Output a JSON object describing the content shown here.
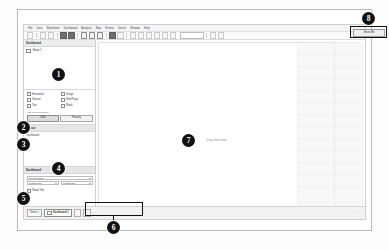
{
  "app": {
    "name": "Tableau Desktop",
    "menu": [
      "File",
      "Data",
      "Worksheet",
      "Dashboard",
      "Analysis",
      "Map",
      "Format",
      "Server",
      "Window",
      "Help"
    ],
    "toolbar_icons": [
      "tableau-logo-icon",
      "back-arrow-icon",
      "forward-arrow-icon",
      "save-icon",
      "new-data-source-icon",
      "pause-refresh-icon",
      "refresh-icon",
      "clear-sheet-icon",
      "undo-icon",
      "redo-icon",
      "swap-rows-columns-icon",
      "sort-ascending-icon",
      "sort-descending-icon",
      "highlight-icon",
      "group-members-icon",
      "show-labels-icon",
      "fit-dropdown-icon",
      "fix-axes-icon",
      "presentation-mode-icon"
    ],
    "toolbar_fit_value": "Standard"
  },
  "left_pane": {
    "title": "Dashboard",
    "sheets_label": "Sheet 1",
    "sheets": [
      {
        "label": "Sheet 1",
        "icon": "worksheet-icon"
      }
    ],
    "objects_title": "Objects",
    "objects": [
      {
        "label": "Horizontal",
        "icon": "horizontal-container-icon"
      },
      {
        "label": "Image",
        "icon": "image-object-icon"
      },
      {
        "label": "Vertical",
        "icon": "vertical-container-icon"
      },
      {
        "label": "Web Page",
        "icon": "web-page-object-icon"
      },
      {
        "label": "Text",
        "icon": "text-object-icon"
      },
      {
        "label": "Blank",
        "icon": "blank-object-icon"
      }
    ],
    "new_objects_label": "Add new objects as:",
    "tiled_label": "Tiled",
    "floating_label": "Floating",
    "layout_title": "Layout",
    "layout_subtitle": "Dashboard",
    "size_title": "Dashboard",
    "size_label": "Size Desktop",
    "size_width_value": "Width  1000",
    "size_height_value": "Height  800",
    "show_title_label": "Show Title"
  },
  "canvas": {
    "drop_text": "Drop sheet here"
  },
  "show_me": {
    "button_label": "Show Me",
    "panel_name": "show-me-panel"
  },
  "tabbar": {
    "tabs": [
      {
        "label": "Sheet 1",
        "active": false,
        "icon": "worksheet-tab-icon"
      },
      {
        "label": "Dashboard 1",
        "active": true,
        "icon": "dashboard-tab-icon"
      }
    ],
    "new_worksheet_icon": "new-worksheet-icon",
    "new_dashboard_icon": "new-dashboard-icon",
    "status_dots": "· · · · ·"
  },
  "annotations": [
    {
      "number": "1",
      "target": "sheets-list-area"
    },
    {
      "number": "2",
      "target": "objects-checkbox-grid"
    },
    {
      "number": "3",
      "target": "tiled-floating-buttons"
    },
    {
      "number": "4",
      "target": "layout-pane"
    },
    {
      "number": "5",
      "target": "dashboard-size-controls"
    },
    {
      "number": "6",
      "target": "sheet-tab-bar"
    },
    {
      "number": "7",
      "target": "dashboard-canvas"
    },
    {
      "number": "8",
      "target": "show-me-button"
    }
  ],
  "colors": {
    "badge_bg": "#111111",
    "badge_text": "#ffffff",
    "highlight_border": "#111111",
    "panel_bg": "#ededed",
    "app_bg": "#ffffff"
  }
}
